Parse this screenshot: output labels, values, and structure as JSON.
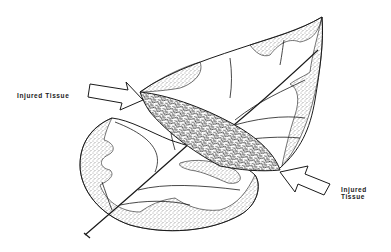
{
  "diagram": {
    "labels": {
      "left": "Injured Tissue",
      "right_line1": "Injured",
      "right_line2": "Tissue"
    },
    "colors": {
      "ink": "#1a1a1a",
      "background": "#ffffff",
      "stipple": "#555555"
    }
  }
}
